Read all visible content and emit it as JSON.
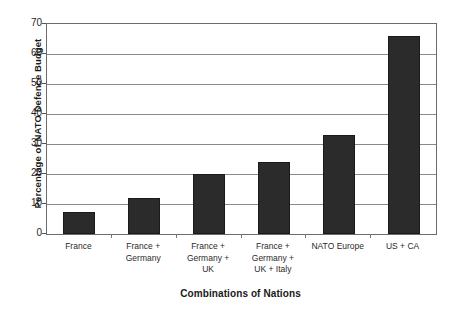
{
  "chart_data": {
    "type": "bar",
    "title": "",
    "xlabel": "Combinations of Nations",
    "ylabel": "Percentage of NATO Defence Budget",
    "categories": [
      "France",
      "France + Germany",
      "France + Germany + UK",
      "France + Germany + UK + Italy",
      "NATO Europe",
      "US + CA"
    ],
    "category_lines": [
      [
        "France"
      ],
      [
        "France +",
        "Germany"
      ],
      [
        "France +",
        "Germany +",
        "UK"
      ],
      [
        "France +",
        "Germany +",
        "UK + Italy"
      ],
      [
        "NATO Europe"
      ],
      [
        "US + CA"
      ]
    ],
    "values": [
      7.5,
      12,
      20,
      24,
      33,
      66
    ],
    "ylim": [
      0,
      70
    ],
    "yticks": [
      0,
      10,
      20,
      30,
      40,
      50,
      60,
      70
    ],
    "ytick_labels": [
      "0",
      "10",
      "20",
      "30",
      "40",
      "50",
      "60",
      "70"
    ],
    "grid": true,
    "grid_axis": "y",
    "legend": false,
    "bar_color": "#2b2b2b",
    "axis_color": "#6b6b6b",
    "gridline_color": "#8a8a8a",
    "background_color": "#ffffff"
  }
}
